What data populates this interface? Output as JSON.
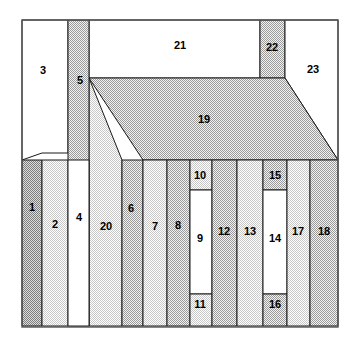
{
  "figure": {
    "canvas": {
      "width": 353,
      "height": 344,
      "background": "#ffffff"
    },
    "frame": {
      "x": 22,
      "y": 20,
      "width": 316,
      "height": 307,
      "stroke": "#555555"
    },
    "fills": {
      "white": "#ffffff",
      "light_gray": "#e6e6e6",
      "mid_gray": "#cfcfcf",
      "dark_gray": "#b3b3b3",
      "outline": "#1a1a1a"
    }
  },
  "regions": [
    {
      "id": "1",
      "label": "1",
      "shade": "dark_gray",
      "label_x": 32,
      "label_y": 208
    },
    {
      "id": "2",
      "label": "2",
      "shade": "light_gray",
      "label_y": 225,
      "label_x": 55
    },
    {
      "id": "3",
      "label": "3",
      "shade": "white",
      "label_x": 43,
      "label_y": 71
    },
    {
      "id": "4",
      "label": "4",
      "shade": "white",
      "label_x": 79,
      "label_y": 218
    },
    {
      "id": "5",
      "label": "5",
      "shade": "mid_gray",
      "label_x": 80,
      "label_y": 81
    },
    {
      "id": "6",
      "label": "6",
      "shade": "mid_gray",
      "label_x": 131,
      "label_y": 209
    },
    {
      "id": "7",
      "label": "7",
      "shade": "light_gray",
      "label_x": 155,
      "label_y": 227
    },
    {
      "id": "8",
      "label": "8",
      "shade": "mid_gray",
      "label_x": 178,
      "label_y": 226
    },
    {
      "id": "9",
      "label": "9",
      "shade": "white",
      "label_x": 200,
      "label_y": 239
    },
    {
      "id": "10",
      "label": "10",
      "shade": "light_gray",
      "label_x": 200,
      "label_y": 176
    },
    {
      "id": "11",
      "label": "11",
      "shade": "light_gray",
      "label_x": 200,
      "label_y": 305
    },
    {
      "id": "12",
      "label": "12",
      "shade": "mid_gray",
      "label_x": 224,
      "label_y": 232
    },
    {
      "id": "13",
      "label": "13",
      "shade": "light_gray",
      "label_x": 250,
      "label_y": 232
    },
    {
      "id": "14",
      "label": "14",
      "shade": "white",
      "label_x": 275,
      "label_y": 239
    },
    {
      "id": "15",
      "label": "15",
      "shade": "mid_gray",
      "label_x": 275,
      "label_y": 176
    },
    {
      "id": "16",
      "label": "16",
      "shade": "mid_gray",
      "label_x": 275,
      "label_y": 305
    },
    {
      "id": "17",
      "label": "17",
      "shade": "light_gray",
      "label_x": 298,
      "label_y": 232
    },
    {
      "id": "18",
      "label": "18",
      "shade": "mid_gray",
      "label_x": 324,
      "label_y": 232
    },
    {
      "id": "19",
      "label": "19",
      "shade": "mid_gray",
      "label_x": 204,
      "label_y": 120
    },
    {
      "id": "20",
      "label": "20",
      "shade": "light_gray",
      "label_x": 106,
      "label_y": 227
    },
    {
      "id": "21",
      "label": "21",
      "shade": "white",
      "label_x": 180,
      "label_y": 46
    },
    {
      "id": "22",
      "label": "22",
      "shade": "mid_gray",
      "label_x": 272,
      "label_y": 48
    },
    {
      "id": "23",
      "label": "23",
      "shade": "white",
      "label_x": 313,
      "label_y": 70
    }
  ],
  "geometry": {
    "note": "Polygon vertex lists in canvas pixel coordinates",
    "shapes": {
      "1": "22,160 42,160 42,326 22,326",
      "2": "42,160 68,160 68,326 42,326",
      "3": "22,20 68,20 68,153 42,153 22,160",
      "4": "68,160 89,160 89,326 68,326",
      "5": "68,20 89,20 89,326 68,326",
      "6": "122,160 143,160 143,326 122,326",
      "7": "143,160 167,160 167,326 143,326",
      "8": "167,160 190,160 190,326 167,326",
      "9": "190,190 212,190 212,294 190,294",
      "10": "190,160 212,160 212,190 190,190",
      "11": "190,294 212,294 212,326 190,326",
      "12": "212,160 237,160 237,326 212,326",
      "13": "237,160 263,160 263,326 237,326",
      "14": "263,190 287,190 287,294 263,294",
      "15": "263,160 287,160 287,190 263,190",
      "16": "263,294 287,294 287,326 263,326",
      "17": "287,160 310,160 310,326 287,326",
      "18": "310,160 338,160 338,326 310,326",
      "19": "89,78 285,78 338,160 143,160 89,78",
      "20": "89,78 122,160 122,326 89,326",
      "21": "89,20 260,20 260,78 89,78",
      "22": "260,20 285,20 285,78 260,78",
      "23": "285,20 338,20 338,160 285,78"
    }
  }
}
